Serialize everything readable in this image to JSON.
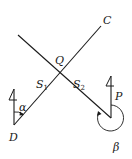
{
  "diagram": {
    "type": "bearing-geometry",
    "stroke_color": "#1a1a1a",
    "background": "#ffffff",
    "points": {
      "D": {
        "label": "D"
      },
      "C": {
        "label": "C"
      },
      "Q": {
        "label": "Q"
      },
      "P": {
        "label": "P"
      }
    },
    "segments": {
      "s1": {
        "label": "S",
        "sub": "1"
      },
      "s2": {
        "label": "S",
        "sub": "2"
      }
    },
    "angles": {
      "alpha": {
        "label": "α"
      },
      "beta": {
        "label": "β"
      }
    },
    "north_arrows": [
      "north-arrow-at-D",
      "north-arrow-at-P"
    ]
  }
}
